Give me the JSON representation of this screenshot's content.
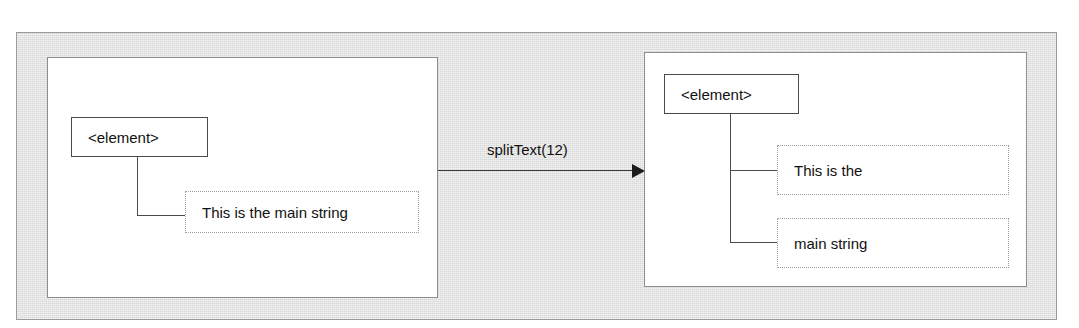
{
  "figure": {
    "colors": {
      "frame_background": "#dedede",
      "panel_background": "#ffffff",
      "node_border": "#4a4a4a",
      "text_node_border": "#9e9e9e",
      "connector": "#4a4a4a",
      "arrow": "#1d1d1d",
      "text": "#111111"
    }
  },
  "before": {
    "element_node": {
      "label": "<element>"
    },
    "text_nodes": [
      {
        "label": "This is the main string"
      }
    ]
  },
  "transition": {
    "label": "splitText(12)",
    "direction": "left-to-right"
  },
  "after": {
    "element_node": {
      "label": "<element>"
    },
    "text_nodes": [
      {
        "label": "This is the"
      },
      {
        "label": "main string"
      }
    ]
  }
}
